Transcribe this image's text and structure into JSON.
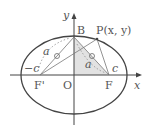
{
  "diagram": {
    "labels": {
      "y_axis": "y",
      "x_axis": "x",
      "origin": "O",
      "B": "B",
      "P": "P(x, y)",
      "F_prime": "F'",
      "F": "F",
      "neg_c": "−c",
      "c": "c",
      "a_left": "a",
      "a_right": "a"
    },
    "colors": {
      "stroke": "#444444",
      "shade": "#dddddd",
      "text": "#555555"
    }
  }
}
